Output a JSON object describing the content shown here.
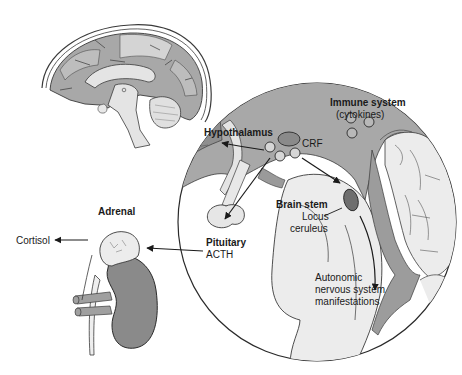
{
  "diagram": {
    "type": "anatomical-illustration",
    "colors": {
      "dark_gray": "#7d7d7d",
      "mid_gray": "#a8a8a8",
      "light_gray": "#d9d9d9",
      "very_light": "#ececec",
      "outline": "#2a2a2a",
      "background": "#ffffff"
    },
    "labels": {
      "immune_system": "Immune system",
      "cytokines": "(cytokines)",
      "hypothalamus": "Hypothalamus",
      "crf": "CRF",
      "brain_stem": "Brain stem",
      "locus": "Locus",
      "ceruleus": "ceruleus",
      "autonomic_1": "Autonomic",
      "autonomic_2": "nervous system",
      "autonomic_3": "manifestations",
      "pituitary": "Pituitary",
      "acth": "ACTH",
      "adrenal_1": "Adrenal",
      "adrenal_2": "gland",
      "cortisol": "Cortisol"
    },
    "nodes": [
      {
        "id": "brain-sagittal",
        "label": "Brain (sagittal view)"
      },
      {
        "id": "magnified-circle",
        "label": "Magnified hypothalamus / brain stem"
      },
      {
        "id": "adrenal-gland",
        "label": "Adrenal gland"
      },
      {
        "id": "kidney",
        "label": "Kidney"
      }
    ],
    "edges": [
      {
        "from": "Hypothalamus",
        "to": "outward",
        "label": ""
      },
      {
        "from": "Hypothalamus",
        "to": "Pituitary",
        "label": "CRF"
      },
      {
        "from": "Hypothalamus",
        "to": "Locus ceruleus",
        "label": ""
      },
      {
        "from": "Locus ceruleus",
        "to": "Autonomic nervous system manifestations",
        "label": ""
      },
      {
        "from": "Pituitary",
        "to": "Adrenal gland",
        "label": "ACTH"
      },
      {
        "from": "Adrenal gland",
        "to": "Cortisol",
        "label": ""
      }
    ]
  }
}
